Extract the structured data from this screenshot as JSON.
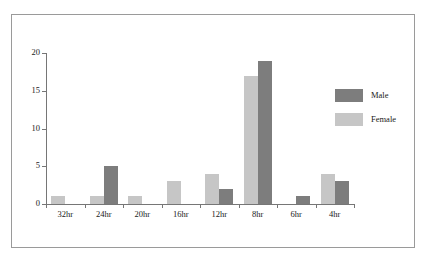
{
  "chart_data": {
    "type": "bar",
    "title": "",
    "subtitle": "",
    "xlabel": "",
    "ylabel": "",
    "categories": [
      "32hr",
      "24hr",
      "20hr",
      "16hr",
      "12hr",
      "8hr",
      "6hr",
      "4hr"
    ],
    "series": [
      {
        "name": "Female",
        "color": "#c6c6c6",
        "values": [
          1,
          1,
          1,
          3,
          4,
          17,
          0,
          4
        ]
      },
      {
        "name": "Male",
        "color": "#7d7d7d",
        "values": [
          0,
          5,
          0,
          0,
          2,
          19,
          1,
          3
        ]
      }
    ],
    "ylim": [
      0,
      20
    ],
    "yticks": [
      0,
      5,
      10,
      15,
      20
    ],
    "ytick_labels": [
      "0",
      "5",
      "10",
      "15",
      "20"
    ],
    "grid": false,
    "legend_position": "right",
    "legend_entries": [
      {
        "label": "Male",
        "color": "#7d7d7d"
      },
      {
        "label": "Female",
        "color": "#c6c6c6"
      }
    ],
    "bar_order_in_group": [
      "Female",
      "Male"
    ],
    "frame_color": "#9a9a9a",
    "axis_color": "#767676"
  }
}
